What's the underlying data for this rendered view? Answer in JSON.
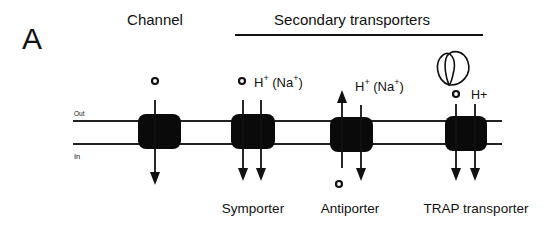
{
  "panel_label": "A",
  "headers": {
    "channel": "Channel",
    "secondary": "Secondary transporters"
  },
  "membrane": {
    "out_label": "Out",
    "in_label": "In"
  },
  "transporters": [
    {
      "name": "Channel",
      "label": ""
    },
    {
      "name": "Symporter",
      "label": "Symporter",
      "ion": "H",
      "ion_sup": "+",
      "alt_ion": "(Na",
      "alt_sup": "+",
      "close": ")"
    },
    {
      "name": "Antiporter",
      "label": "Antiporter",
      "ion": "H",
      "ion_sup": "+",
      "alt_ion": "(Na",
      "alt_sup": "+",
      "close": ")"
    },
    {
      "name": "TRAP transporter",
      "label": "TRAP transporter",
      "ion": "H+"
    }
  ],
  "colors": {
    "ink": "#111111",
    "background": "#ffffff"
  }
}
